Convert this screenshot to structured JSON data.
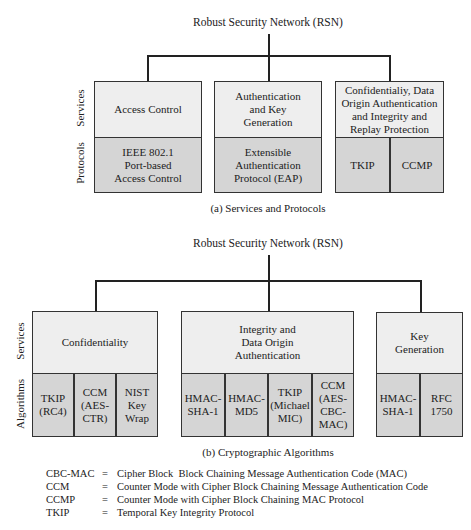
{
  "diagram_a": {
    "title": "Robust Security Network (RSN)",
    "row_labels": {
      "top": "Services",
      "bottom": "Protocols"
    },
    "caption": "(a) Services and Protocols",
    "columns": [
      {
        "service": "Access Control",
        "items": [
          "IEEE 802.1\nPort-based\nAccess Control"
        ]
      },
      {
        "service": "Authentication\nand Key\nGeneration",
        "items": [
          "Extensible\nAuthentication\nProtocol (EAP)"
        ]
      },
      {
        "service": "Confidentialiy, Data\nOrigin Authentication\nand Integrity and\nReplay Protection",
        "items": [
          "TKIP",
          "CCMP"
        ]
      }
    ]
  },
  "diagram_b": {
    "title": "Robust Security Network (RSN)",
    "row_labels": {
      "top": "Services",
      "bottom": "Algorithms"
    },
    "caption": "(b) Cryptographic Algorithms",
    "columns": [
      {
        "service": "Confidentiality",
        "items": [
          "TKIP\n(RC4)",
          "CCM\n(AES-\nCTR)",
          "NIST\nKey\nWrap"
        ]
      },
      {
        "service": "Integrity and\nData Origin\nAuthentication",
        "items": [
          "HMAC-\nSHA-1",
          "HMAC-\nMD5",
          "TKIP\n(Michael\nMIC)",
          "CCM\n(AES-\nCBC-\nMAC)"
        ]
      },
      {
        "service": "Key\nGeneration",
        "items": [
          "HMAC-\nSHA-1",
          "RFC\n1750"
        ]
      }
    ]
  },
  "legend": [
    {
      "term": "CBC-MAC",
      "eq": "=",
      "definition": "Cipher Block  Block Chaining Message Authentication Code (MAC)"
    },
    {
      "term": "CCM",
      "eq": "=",
      "definition": "Counter Mode with Cipher Block Chaining Message Authentication Code"
    },
    {
      "term": "CCMP",
      "eq": "=",
      "definition": "Counter Mode with Cipher Block Chaining MAC Protocol"
    },
    {
      "term": "TKIP",
      "eq": "=",
      "definition": "Temporal Key Integrity Protocol"
    }
  ],
  "colors": {
    "service_fill": "#eeeeee",
    "algorithm_fill": "#d5d5d5",
    "stroke": "#333333"
  }
}
